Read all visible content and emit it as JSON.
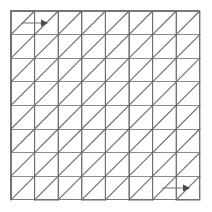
{
  "figure": {
    "type": "diagram",
    "caption": ""
  },
  "canvas": {
    "width": 212,
    "height": 212,
    "background_color": "#ffffff"
  },
  "grid": {
    "columns": 8,
    "rows": 8,
    "origin_x": 11,
    "origin_y": 11,
    "cell_size": 23.6,
    "line_color": "#8c8c8c",
    "border_color": "#7a7a7a",
    "line_width": 1
  },
  "path": {
    "color": "#6e6e6e",
    "line_width": 1.15,
    "description": "Continuous boustrophedon path of parallel up-right diagonals linked by horizontal connectors on the top and bottom rows and vertical hook turnarounds at the left and right edges",
    "diagonal_direction": "up-right",
    "turnaround_style": "vertical-hook",
    "segment_count": 64
  },
  "arrows": [
    {
      "name": "start-arrow",
      "label": "start",
      "direction": "right",
      "x": 22,
      "y": 23,
      "length": 26,
      "color": "#4a4a4a"
    },
    {
      "name": "end-arrow",
      "label": "end",
      "direction": "right",
      "x": 163,
      "y": 188,
      "length": 27,
      "color": "#4a4a4a"
    }
  ]
}
